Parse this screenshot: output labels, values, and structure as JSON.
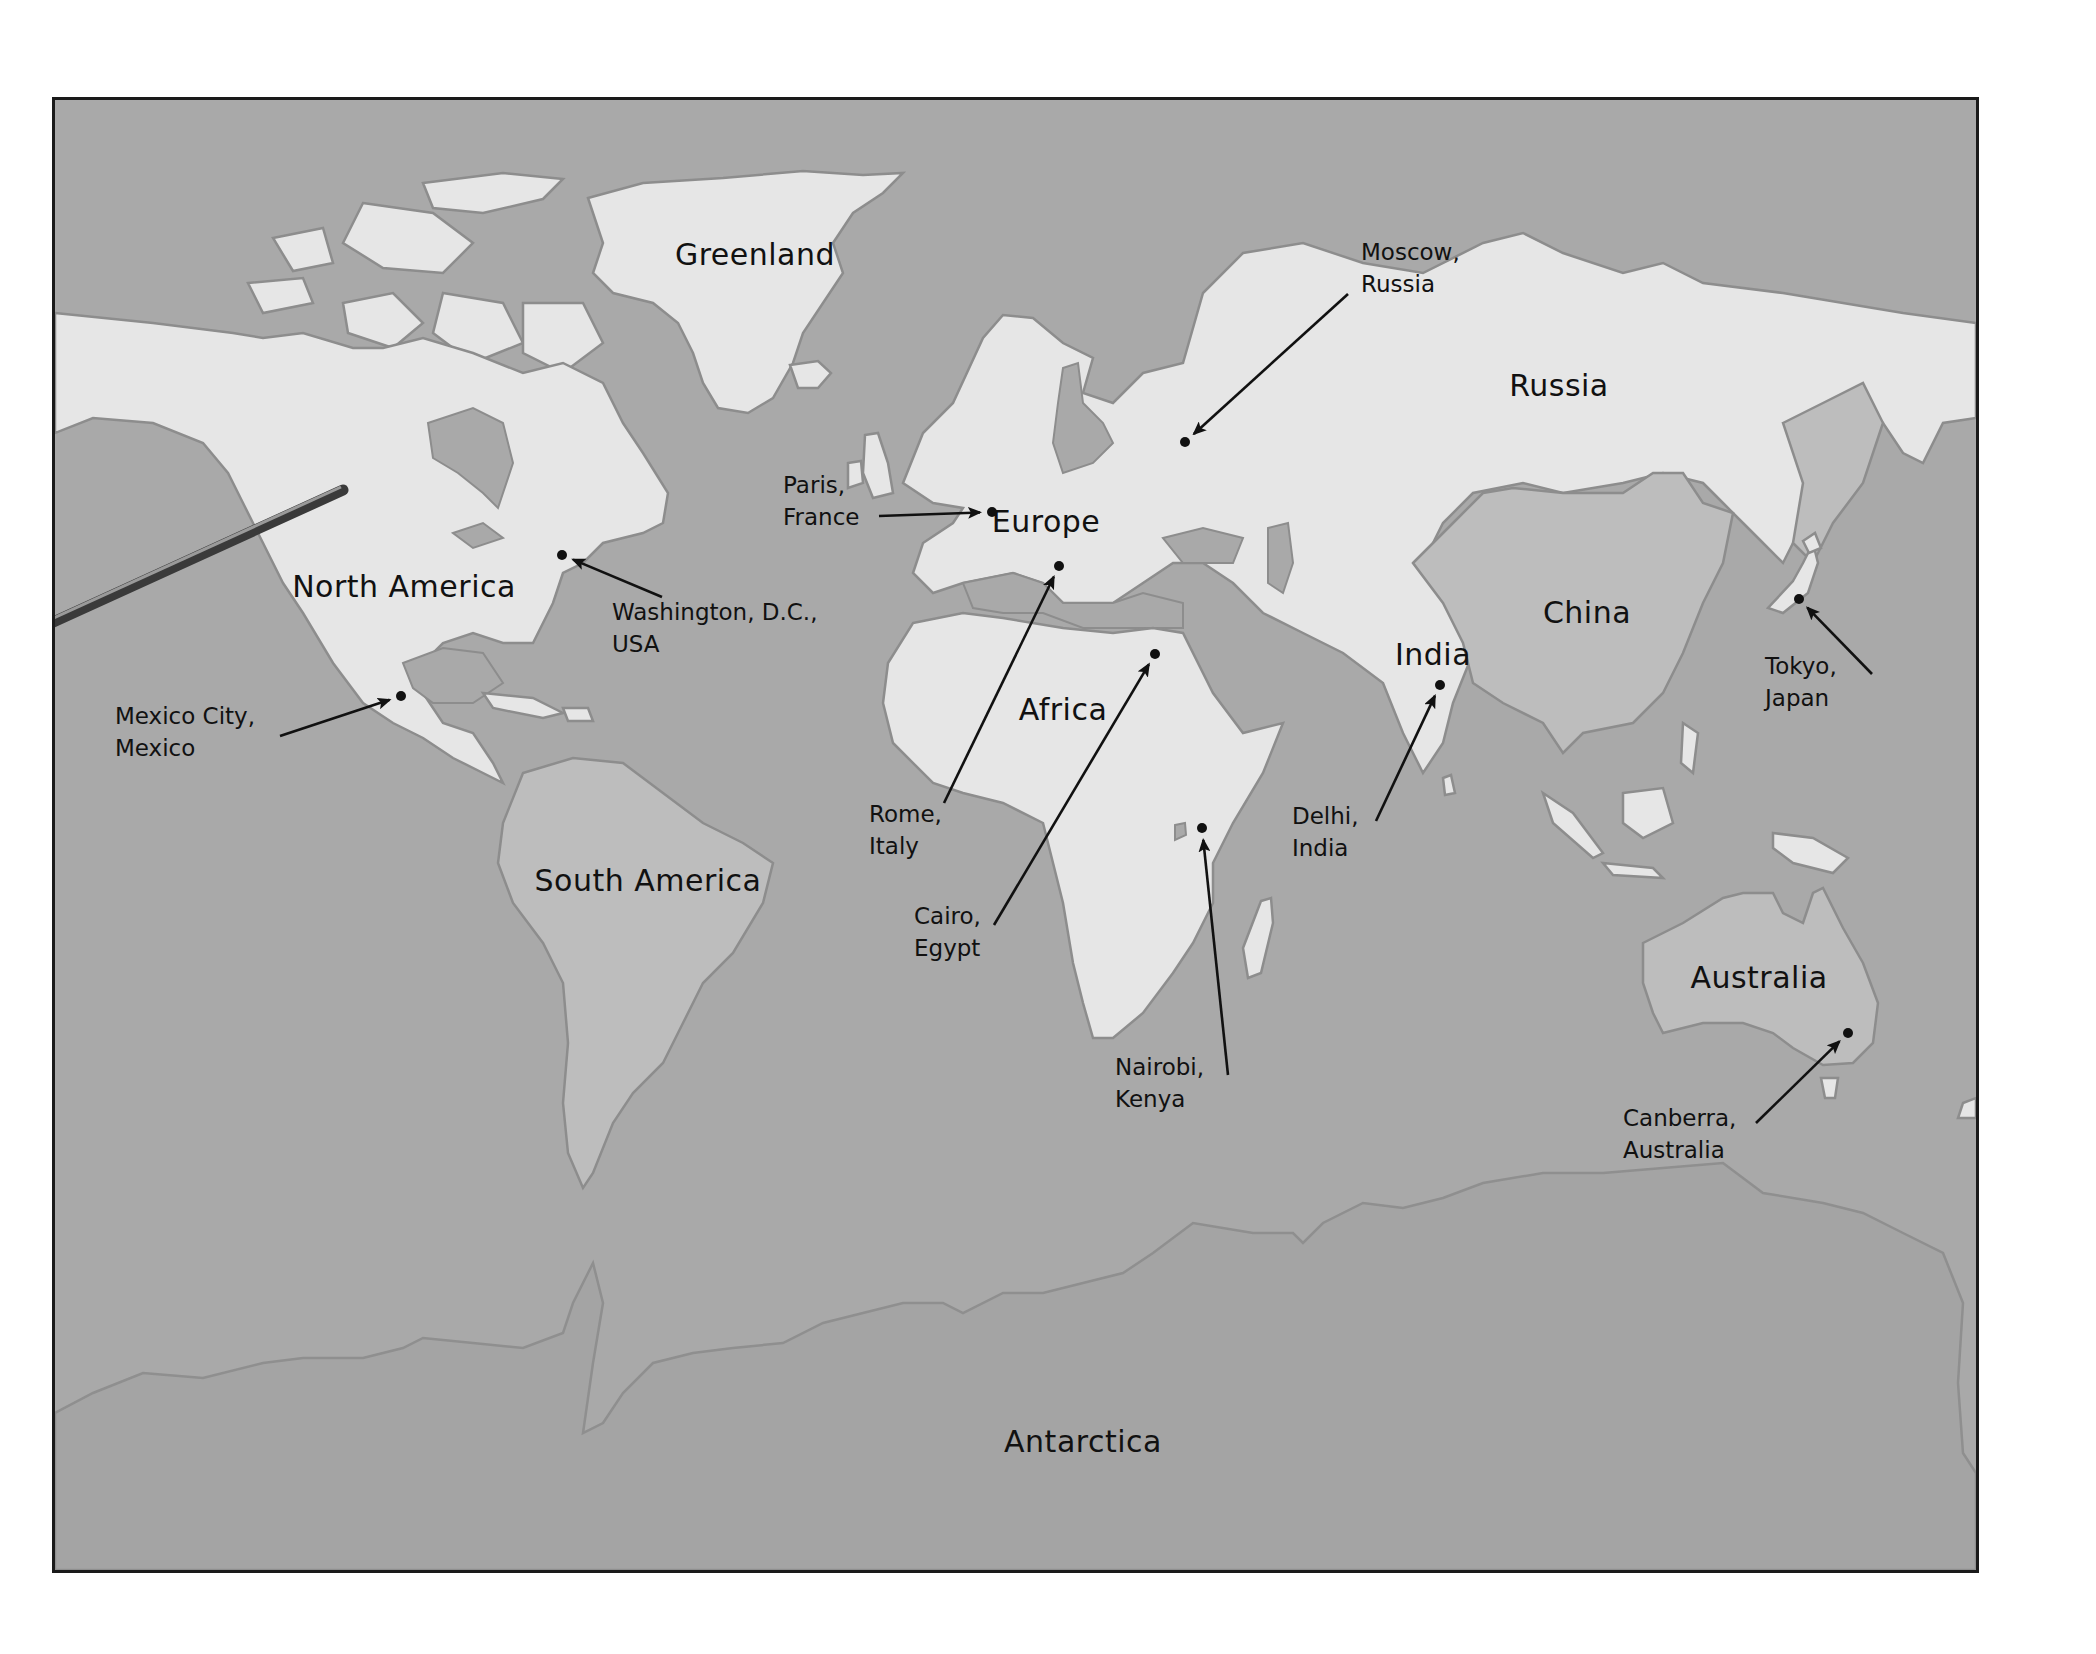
{
  "map": {
    "type": "world-map",
    "colors": {
      "ocean": "#a9a9a9",
      "land": "#e6e6e6",
      "highlighted_land": "#bdbdbd",
      "border": "#1a1a1a",
      "text": "#111111"
    },
    "regions": [
      {
        "id": "greenland",
        "label": "Greenland",
        "x": 755,
        "y": 254
      },
      {
        "id": "north-america",
        "label": "North America",
        "x": 404,
        "y": 586
      },
      {
        "id": "south-america",
        "label": "South America",
        "x": 648,
        "y": 880
      },
      {
        "id": "europe",
        "label": "Europe",
        "x": 1046,
        "y": 521
      },
      {
        "id": "africa",
        "label": "Africa",
        "x": 1063,
        "y": 709
      },
      {
        "id": "russia",
        "label": "Russia",
        "x": 1559,
        "y": 385
      },
      {
        "id": "china",
        "label": "China",
        "x": 1587,
        "y": 612
      },
      {
        "id": "india",
        "label": "India",
        "x": 1433,
        "y": 654
      },
      {
        "id": "australia",
        "label": "Australia",
        "x": 1759,
        "y": 977
      },
      {
        "id": "antarctica",
        "label": "Antarctica",
        "x": 1083,
        "y": 1441
      }
    ],
    "cities": [
      {
        "id": "moscow",
        "line1": "Moscow,",
        "line2": "Russia",
        "dot": [
          1182,
          439
        ],
        "label_pos": [
          1361,
          236
        ],
        "arrow_from": [
          1345,
          291
        ]
      },
      {
        "id": "paris",
        "line1": "Paris,",
        "line2": "France",
        "dot": [
          989,
          509
        ],
        "label_pos": [
          783,
          469
        ],
        "arrow_from": [
          876,
          513
        ]
      },
      {
        "id": "washington",
        "line1": "Washington, D.C.,",
        "line2": "USA",
        "dot": [
          559,
          552
        ],
        "label_pos": [
          612,
          596
        ],
        "arrow_from": [
          659,
          594
        ]
      },
      {
        "id": "mexico-city",
        "line1": "Mexico City,",
        "line2": "Mexico",
        "dot": [
          398,
          693
        ],
        "label_pos": [
          115,
          700
        ],
        "arrow_from": [
          277,
          733
        ]
      },
      {
        "id": "rome",
        "line1": "Rome,",
        "line2": "Italy",
        "dot": [
          1056,
          563
        ],
        "label_pos": [
          869,
          798
        ],
        "arrow_from": [
          941,
          800
        ]
      },
      {
        "id": "cairo",
        "line1": "Cairo,",
        "line2": "Egypt",
        "dot": [
          1152,
          651
        ],
        "label_pos": [
          914,
          900
        ],
        "arrow_from": [
          991,
          922
        ]
      },
      {
        "id": "nairobi",
        "line1": "Nairobi,",
        "line2": "Kenya",
        "dot": [
          1199,
          825
        ],
        "label_pos": [
          1115,
          1051
        ],
        "arrow_from": [
          1225,
          1072
        ]
      },
      {
        "id": "delhi",
        "line1": "Delhi,",
        "line2": "India",
        "dot": [
          1437,
          682
        ],
        "label_pos": [
          1292,
          800
        ],
        "arrow_from": [
          1373,
          818
        ]
      },
      {
        "id": "tokyo",
        "line1": "Tokyo,",
        "line2": "Japan",
        "dot": [
          1796,
          596
        ],
        "label_pos": [
          1765,
          650
        ],
        "arrow_from": [
          1869,
          671
        ]
      },
      {
        "id": "canberra",
        "line1": "Canberra,",
        "line2": "Australia",
        "dot": [
          1845,
          1030
        ],
        "label_pos": [
          1623,
          1102
        ],
        "arrow_from": [
          1753,
          1120
        ]
      }
    ],
    "pointer": {
      "tip": [
        340,
        487
      ],
      "end": [
        0,
        642
      ]
    }
  }
}
